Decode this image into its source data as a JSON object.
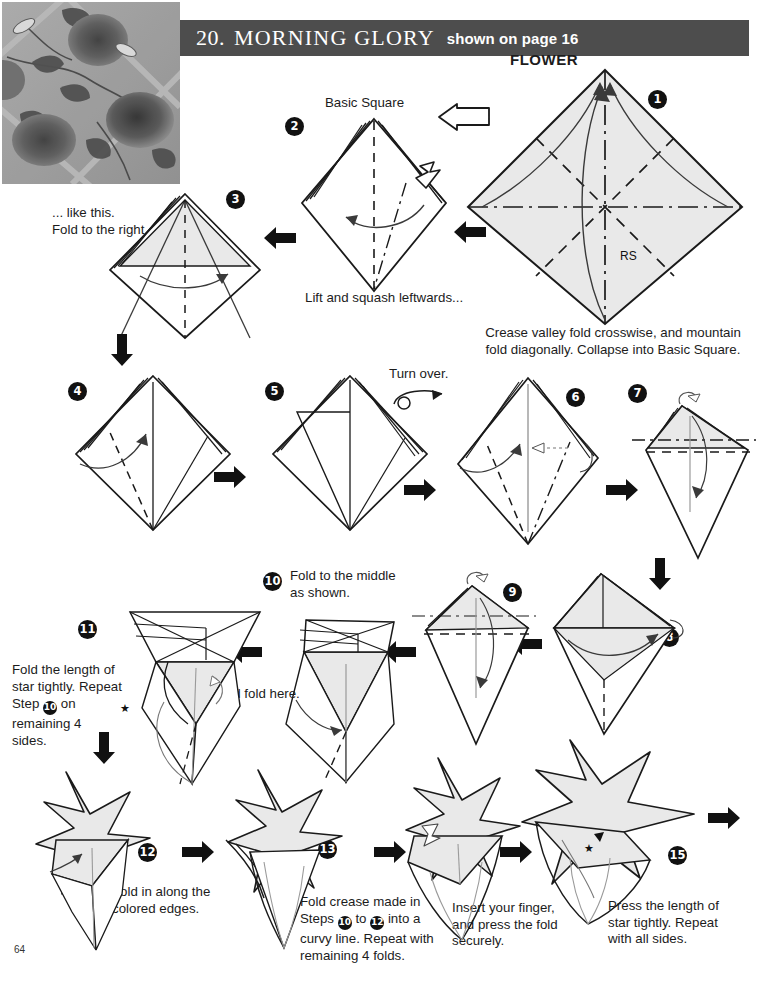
{
  "page": {
    "number": "64",
    "background": "#ffffff",
    "paper_fill": "#e9e9e9",
    "line_color": "#1a1a1a",
    "header_bg": "#4d4d4d"
  },
  "header": {
    "number": "20.",
    "title": "MORNING GLORY",
    "subtitle": "shown on page 16"
  },
  "photo": {
    "alt": "morning-glory-flowers-photo"
  },
  "labels": {
    "flower": "FLOWER",
    "rs": "RS",
    "basic_square": "Basic Square",
    "turn_over": "Turn over.",
    "star": "★"
  },
  "steps": [
    {
      "n": "1",
      "badge": "❶",
      "caption": "Crease valley fold crosswise, and mountain\nfold diagonally. Collapse into Basic Square."
    },
    {
      "n": "2",
      "badge": "❷",
      "title": "Basic Square",
      "caption": "Lift and squash leftwards..."
    },
    {
      "n": "3",
      "badge": "❸",
      "caption": "... like this.\nFold to the right."
    },
    {
      "n": "4",
      "badge": "❹",
      "caption": ""
    },
    {
      "n": "5",
      "badge": "❺",
      "caption": ""
    },
    {
      "n": "6",
      "badge": "❻",
      "caption": ""
    },
    {
      "n": "7",
      "badge": "❼",
      "caption": ""
    },
    {
      "n": "8",
      "badge": "❽",
      "caption": ""
    },
    {
      "n": "9",
      "badge": "❾",
      "caption": ""
    },
    {
      "n": "10",
      "badge": "❿",
      "caption": "Fold to the middle\nas shown.",
      "caption2": "End fold here."
    },
    {
      "n": "11",
      "badge": "①",
      "caption_parts": [
        "Fold the length of",
        "star tightly. Repeat",
        "Step ",
        " on",
        "remaining 4",
        "sides."
      ]
    },
    {
      "n": "12",
      "badge": "②",
      "caption": "Fold in along the\ncolored edges."
    },
    {
      "n": "13",
      "badge": "③",
      "caption_parts": [
        "Fold crease made in",
        "Steps ",
        " to ",
        " into a",
        "curvy line. Repeat with",
        "remaining 4 folds."
      ]
    },
    {
      "n": "14",
      "badge": "④",
      "caption": "Insert your finger,\nand press the fold\nsecurely."
    },
    {
      "n": "15",
      "badge": "⑤",
      "caption": "Press the length of\nstar tightly. Repeat\nwith all sides."
    }
  ],
  "arrows": {
    "black_left": "arrow-left",
    "black_right": "arrow-right",
    "black_down": "arrow-down",
    "hollow_push": "hollow-push-arrow",
    "turn_over_symbol": "turn-over-arrow"
  }
}
